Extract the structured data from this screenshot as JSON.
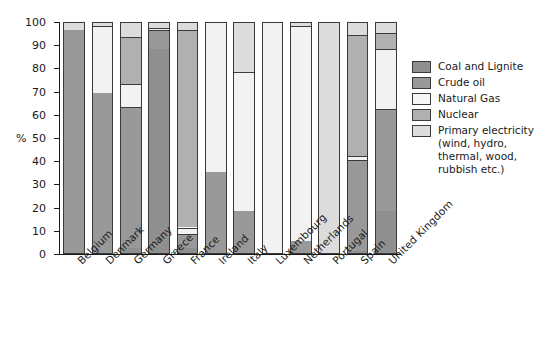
{
  "chart_data": {
    "type": "bar",
    "stacked": true,
    "title": "",
    "xlabel": "",
    "ylabel": "%",
    "ylim": [
      0,
      100
    ],
    "yticks": [
      0,
      10,
      20,
      30,
      40,
      50,
      60,
      70,
      80,
      90,
      100
    ],
    "grid": false,
    "legend_position": "right",
    "categories": [
      "Belgium",
      "Denmark",
      "Germany",
      "Greece",
      "France",
      "Ireland",
      "Italy",
      "Luxembourg",
      "Netherlands",
      "Portugal",
      "Spain",
      "United Kingdom"
    ],
    "series": [
      {
        "name": "Coal and Lignite",
        "color": "#8f8f8f",
        "values": [
          0,
          0,
          2,
          88,
          2,
          0,
          0,
          0,
          0,
          0,
          1,
          18
        ]
      },
      {
        "name": "Crude oil",
        "color": "#999999",
        "values": [
          96,
          69,
          61,
          8,
          6,
          35,
          18,
          0,
          5,
          0,
          39,
          44
        ]
      },
      {
        "name": "Natural Gas",
        "color": "#f2f2f2",
        "values": [
          0,
          29,
          10,
          1,
          3,
          65,
          60,
          100,
          93,
          0,
          2,
          26
        ]
      },
      {
        "name": "Nuclear",
        "color": "#b0b0b0",
        "values": [
          0,
          0,
          20,
          0,
          85,
          0,
          0,
          0,
          0,
          0,
          52,
          7
        ]
      },
      {
        "name": "Primary electricity",
        "color": "#dcdcdc",
        "values": [
          4,
          2,
          7,
          3,
          4,
          0,
          22,
          0,
          2,
          100,
          6,
          5
        ]
      }
    ],
    "legend_entries": [
      {
        "label": "Coal and Lignite",
        "color": "#8f8f8f",
        "sub": ""
      },
      {
        "label": "Crude oil",
        "color": "#999999",
        "sub": ""
      },
      {
        "label": "Natural Gas",
        "color": "#f7f7f7",
        "sub": ""
      },
      {
        "label": "Nuclear",
        "color": "#b0b0b0",
        "sub": ""
      },
      {
        "label": "Primary electricity",
        "color": "#dcdcdc",
        "sub": "(wind, hydro, thermal, wood, rubbish etc.)"
      }
    ]
  },
  "axis": {
    "y_unit": "%",
    "y_tick_labels": [
      "0",
      "10",
      "20",
      "30",
      "40",
      "50",
      "60",
      "70",
      "80",
      "90",
      "100"
    ]
  }
}
